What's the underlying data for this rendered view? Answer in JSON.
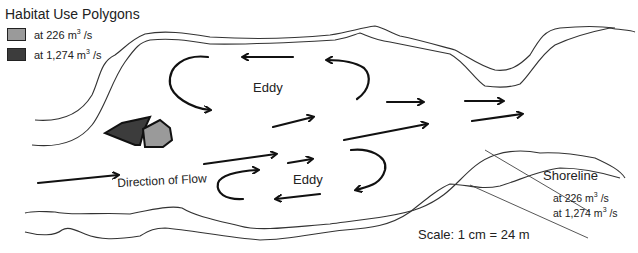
{
  "legend": {
    "title": "Habitat Use Polygons",
    "items": [
      {
        "label_prefix": "at 226 m",
        "sup": "3",
        "label_suffix": " /s",
        "color": "#9a9a9a"
      },
      {
        "label_prefix": "at 1,274 m",
        "sup": "3",
        "label_suffix": " /s",
        "color": "#3c3c3c"
      }
    ]
  },
  "labels": {
    "eddy_top": "Eddy",
    "eddy_bottom": "Eddy",
    "direction": "Direction of Flow",
    "shoreline": "Shoreline",
    "shoreline_226_prefix": "at 226 m",
    "shoreline_226_sup": "3",
    "shoreline_226_suffix": " /s",
    "shoreline_1274_prefix": "at 1,274 m",
    "shoreline_1274_sup": "3",
    "shoreline_1274_suffix": " /s",
    "scale": "Scale: 1 cm = 24 m"
  },
  "colors": {
    "polygon_226": "#9a9a9a",
    "polygon_1274": "#3c3c3c",
    "line": "#333333"
  }
}
